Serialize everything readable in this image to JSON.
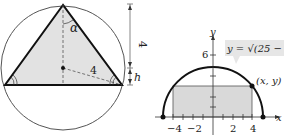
{
  "left_figure": {
    "angle_label": "α",
    "radius_label": "4",
    "height_label": "4",
    "h_label": "h"
  },
  "right_figure": {
    "equation": "y = √(25 − x²)",
    "point_label": "(x, y)",
    "x_axis_label": "x",
    "y_axis_label": "y",
    "x_ticks": [
      "−4",
      "−2",
      "2",
      "4"
    ],
    "y_ticks": [
      "6"
    ],
    "colors": {
      "fill": "#d9d9d9",
      "stroke": "#111111",
      "label_box": "#e6e6e6"
    }
  }
}
